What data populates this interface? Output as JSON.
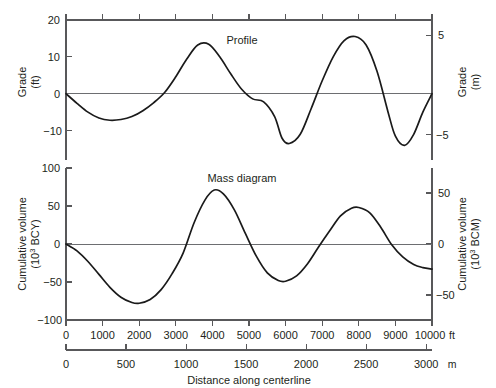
{
  "figure": {
    "background": "#ffffff",
    "curve_color": "#1a1a1a",
    "axis_color": "#58585a",
    "zero_line_color": "#6d6e71"
  },
  "xaxis": {
    "label": "Distance along centerline",
    "primary_unit": "ft",
    "secondary_unit": "m",
    "ft_ticks": [
      "0",
      "1000",
      "2000",
      "3000",
      "4000",
      "5000",
      "6000",
      "7000",
      "8000",
      "9000",
      "10000"
    ],
    "m_ticks": [
      "0",
      "500",
      "1000",
      "1500",
      "2000",
      "2500",
      "3000"
    ],
    "ft_range": [
      0,
      10000
    ],
    "m_range": [
      0,
      3048
    ]
  },
  "profile_panel": {
    "title": "Profile",
    "left_axis_title_line1": "Grade",
    "left_axis_title_line2": "(ft)",
    "right_axis_title_line1": "Grade",
    "right_axis_title_line2": "(m)",
    "left_ticks": [
      "20",
      "10",
      "0",
      "−10"
    ],
    "right_ticks": [
      "5",
      "−5"
    ]
  },
  "mass_panel": {
    "title": "Mass diagram",
    "left_axis_title_line1": "Cumulative volume",
    "left_axis_title_line2_pre": "(10",
    "left_axis_title_line2_sup": "3",
    "left_axis_title_line2_post": " BCY)",
    "right_axis_title_line1": "Cumulative volume",
    "right_axis_title_line2_pre": "(10",
    "right_axis_title_line2_sup": "3",
    "right_axis_title_line2_post": " BCM)",
    "left_ticks": [
      "100",
      "50",
      "0",
      "−50",
      "−100"
    ],
    "right_ticks": [
      "50",
      "0",
      "−50"
    ]
  },
  "chart_data": [
    {
      "type": "line",
      "title": "Profile",
      "xlabel": "Distance along centerline",
      "ylabel": "Grade (ft)",
      "ylabel_secondary": "Grade (m)",
      "xunit": "ft",
      "xunit_secondary": "m",
      "xlim": [
        0,
        10000
      ],
      "ylim": [
        -18,
        20
      ],
      "ylim_secondary": [
        -5.49,
        6.1
      ],
      "yticks": [
        20,
        10,
        0,
        -10
      ],
      "yticks_secondary": [
        5,
        0,
        -5
      ],
      "xticks": [
        0,
        1000,
        2000,
        3000,
        4000,
        5000,
        6000,
        7000,
        8000,
        9000,
        10000
      ],
      "xticks_secondary": [
        0,
        500,
        1000,
        1500,
        2000,
        2500,
        3000
      ],
      "grid": false,
      "legend": "none",
      "zero_reference_line": true,
      "series": [
        {
          "name": "Profile grade",
          "x": [
            0,
            300,
            600,
            900,
            1200,
            1500,
            1800,
            2100,
            2400,
            2700,
            3000,
            3300,
            3600,
            3900,
            4200,
            4500,
            4800,
            5100,
            5400,
            5700,
            5900,
            6100,
            6400,
            6700,
            7000,
            7300,
            7600,
            7900,
            8200,
            8500,
            8800,
            9000,
            9250,
            9500,
            9750,
            10000
          ],
          "y": [
            0,
            -2.6,
            -5.0,
            -6.6,
            -7.2,
            -7.0,
            -6.2,
            -4.6,
            -2.4,
            0.4,
            4.6,
            9.4,
            13.2,
            13.4,
            10.0,
            5.4,
            1.2,
            -1.4,
            -2.2,
            -6.2,
            -12.0,
            -13.5,
            -11.0,
            -4.0,
            3.5,
            10.0,
            14.4,
            15.5,
            13.2,
            6.0,
            -5.0,
            -11.5,
            -14.0,
            -11.0,
            -5.0,
            0
          ]
        }
      ]
    },
    {
      "type": "line",
      "title": "Mass diagram",
      "xlabel": "Distance along centerline",
      "ylabel": "Cumulative volume (10^3 BCY)",
      "ylabel_secondary": "Cumulative volume (10^3 BCM)",
      "xunit": "ft",
      "xunit_secondary": "m",
      "xlim": [
        0,
        10000
      ],
      "ylim": [
        -100,
        120
      ],
      "ylim_secondary": [
        -76.5,
        91.7
      ],
      "yticks": [
        100,
        50,
        0,
        -50,
        -100
      ],
      "yticks_secondary": [
        50,
        0,
        -50
      ],
      "xticks": [
        0,
        1000,
        2000,
        3000,
        4000,
        5000,
        6000,
        7000,
        8000,
        9000,
        10000
      ],
      "xticks_secondary": [
        0,
        500,
        1000,
        1500,
        2000,
        2500,
        3000
      ],
      "grid": false,
      "legend": "none",
      "zero_reference_line": true,
      "series": [
        {
          "name": "Cumulative volume",
          "x": [
            0,
            300,
            600,
            900,
            1200,
            1500,
            1800,
            2000,
            2300,
            2600,
            2900,
            3200,
            3500,
            3800,
            4050,
            4300,
            4600,
            4900,
            5200,
            5500,
            5800,
            6000,
            6300,
            6600,
            6900,
            7200,
            7500,
            7800,
            8000,
            8300,
            8600,
            8900,
            9200,
            9500,
            9750,
            10000
          ],
          "y": [
            0,
            -9,
            -23,
            -40,
            -57,
            -70,
            -77,
            -78,
            -73,
            -60,
            -39,
            -12,
            28,
            58,
            71,
            66,
            45,
            14,
            -16,
            -38,
            -48,
            -49,
            -42,
            -26,
            -4,
            17,
            37,
            47,
            48,
            41,
            22,
            -1,
            -17,
            -27,
            -31,
            -33
          ]
        }
      ]
    }
  ]
}
